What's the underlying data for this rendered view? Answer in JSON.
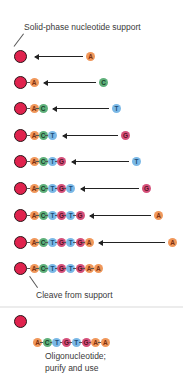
{
  "diagram": {
    "title_label": "Solid-phase nucleotide support",
    "cleave_label": "Cleave from support",
    "caption_line1": "Oligonucleotide;",
    "caption_line2": "purify and use",
    "colors": {
      "bead": "#e0234e",
      "A": "#f0975a",
      "C": "#5fb07a",
      "T": "#7ab8e6",
      "G": "#d5507a"
    },
    "steps": [
      {
        "chain": [],
        "incoming": "A"
      },
      {
        "chain": [
          "A"
        ],
        "incoming": "C"
      },
      {
        "chain": [
          "A",
          "C"
        ],
        "incoming": "T"
      },
      {
        "chain": [
          "A",
          "C",
          "T"
        ],
        "incoming": "G"
      },
      {
        "chain": [
          "A",
          "C",
          "T",
          "G"
        ],
        "incoming": "T"
      },
      {
        "chain": [
          "A",
          "C",
          "T",
          "G",
          "T"
        ],
        "incoming": "G"
      },
      {
        "chain": [
          "A",
          "C",
          "T",
          "G",
          "T",
          "G"
        ],
        "incoming": "A"
      },
      {
        "chain": [
          "A",
          "C",
          "T",
          "G",
          "T",
          "G",
          "A"
        ],
        "incoming": "A"
      },
      {
        "chain": [
          "A",
          "C",
          "T",
          "G",
          "T",
          "G",
          "A",
          "A"
        ],
        "incoming": null
      }
    ],
    "final_oligo": [
      "A",
      "C",
      "T",
      "G",
      "T",
      "G",
      "A",
      "A"
    ]
  }
}
